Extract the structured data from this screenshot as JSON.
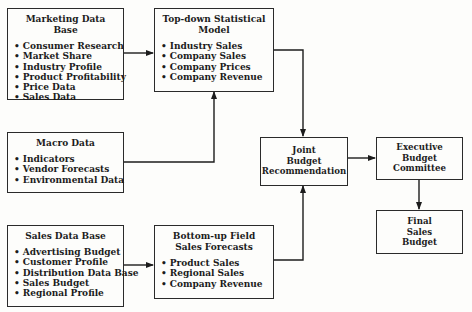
{
  "boxes": {
    "marketing": {
      "title": "Marketing Data Base",
      "items": [
        "Consumer Research",
        "Market Share",
        "Industry Profile",
        "Product Profitability",
        "Price Data",
        "Sales Data"
      ]
    },
    "topdown": {
      "title": "Top-down Statistical\nModel",
      "items": [
        "Industry Sales",
        "Company Sales",
        "Company Prices",
        "Company Revenue"
      ]
    },
    "macro": {
      "title": "Macro Data",
      "items": [
        "Indicators",
        "Vendor Forecasts",
        "Environmental Data"
      ]
    },
    "salesdb": {
      "title": "Sales Data Base",
      "items": [
        "Advertising Budget",
        "Customer Profile",
        "Distribution Data Base",
        "Sales Budget",
        "Regional Profile"
      ]
    },
    "bottomup": {
      "title": "Bottom-up Field\nSales Forecasts",
      "items": [
        "Product Sales",
        "Regional Sales",
        "Company Revenue"
      ]
    },
    "joint": {
      "title": "Joint\nBudget\nRecommendation"
    },
    "executive": {
      "title": "Executive\nBudget\nCommittee"
    },
    "final": {
      "title": "Final\nSales\nBudget"
    }
  },
  "edges": [
    {
      "from": "Marketing Data Base",
      "to": "Top-down Statistical Model"
    },
    {
      "from": "Macro Data",
      "to": "Top-down Statistical Model"
    },
    {
      "from": "Top-down Statistical Model",
      "to": "Joint Budget Recommendation"
    },
    {
      "from": "Sales Data Base",
      "to": "Bottom-up Field Sales Forecasts"
    },
    {
      "from": "Bottom-up Field Sales Forecasts",
      "to": "Joint Budget Recommendation"
    },
    {
      "from": "Joint Budget Recommendation",
      "to": "Executive Budget Committee"
    },
    {
      "from": "Executive Budget Committee",
      "to": "Final Sales Budget"
    }
  ]
}
